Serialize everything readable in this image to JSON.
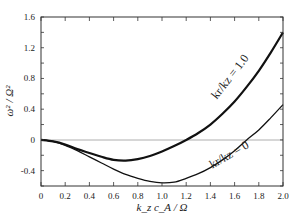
{
  "chart_data": {
    "type": "line",
    "title": "",
    "xlabel": "k_z c_A / Ω",
    "ylabel": "ω² / Ω²",
    "xlim": [
      0,
      2.0
    ],
    "ylim": [
      -0.6,
      1.6
    ],
    "xticks": [
      "0",
      "0.2",
      "0.4",
      "0.6",
      "0.8",
      "1.0",
      "1.2",
      "1.4",
      "1.6",
      "1.8",
      "2.0"
    ],
    "yticks": [
      "1.6",
      "1.2",
      "0.8",
      "0.4",
      "0",
      "-0.4"
    ],
    "grid": false,
    "zero_line": true,
    "x": [
      0,
      0.1,
      0.2,
      0.3,
      0.4,
      0.5,
      0.6,
      0.7,
      0.8,
      0.9,
      1.0,
      1.1,
      1.2,
      1.3,
      1.4,
      1.5,
      1.6,
      1.7,
      1.8,
      1.9,
      2.0
    ],
    "series": [
      {
        "name": "k_r/k_z = 1.0",
        "label": "kr/kz = 1.0",
        "stroke_width": 2.2,
        "values": [
          0,
          -0.02,
          -0.06,
          -0.12,
          -0.17,
          -0.22,
          -0.26,
          -0.27,
          -0.25,
          -0.21,
          -0.15,
          -0.08,
          0.0,
          0.09,
          0.2,
          0.34,
          0.5,
          0.69,
          0.9,
          1.14,
          1.4
        ]
      },
      {
        "name": "k_r/k_z = 0",
        "label": "kr/kz = 0",
        "stroke_width": 1.3,
        "values": [
          0,
          -0.02,
          -0.07,
          -0.14,
          -0.22,
          -0.3,
          -0.38,
          -0.45,
          -0.5,
          -0.54,
          -0.56,
          -0.55,
          -0.5,
          -0.44,
          -0.36,
          -0.26,
          -0.14,
          0.0,
          0.13,
          0.29,
          0.46
        ]
      }
    ],
    "annotations": [
      {
        "text": "kr/kz = 1.0",
        "x": 1.5,
        "y": 0.75,
        "rotation": -52
      },
      {
        "text": "kr/kz = 0",
        "x": 1.55,
        "y": -0.3,
        "rotation": -30
      }
    ]
  }
}
